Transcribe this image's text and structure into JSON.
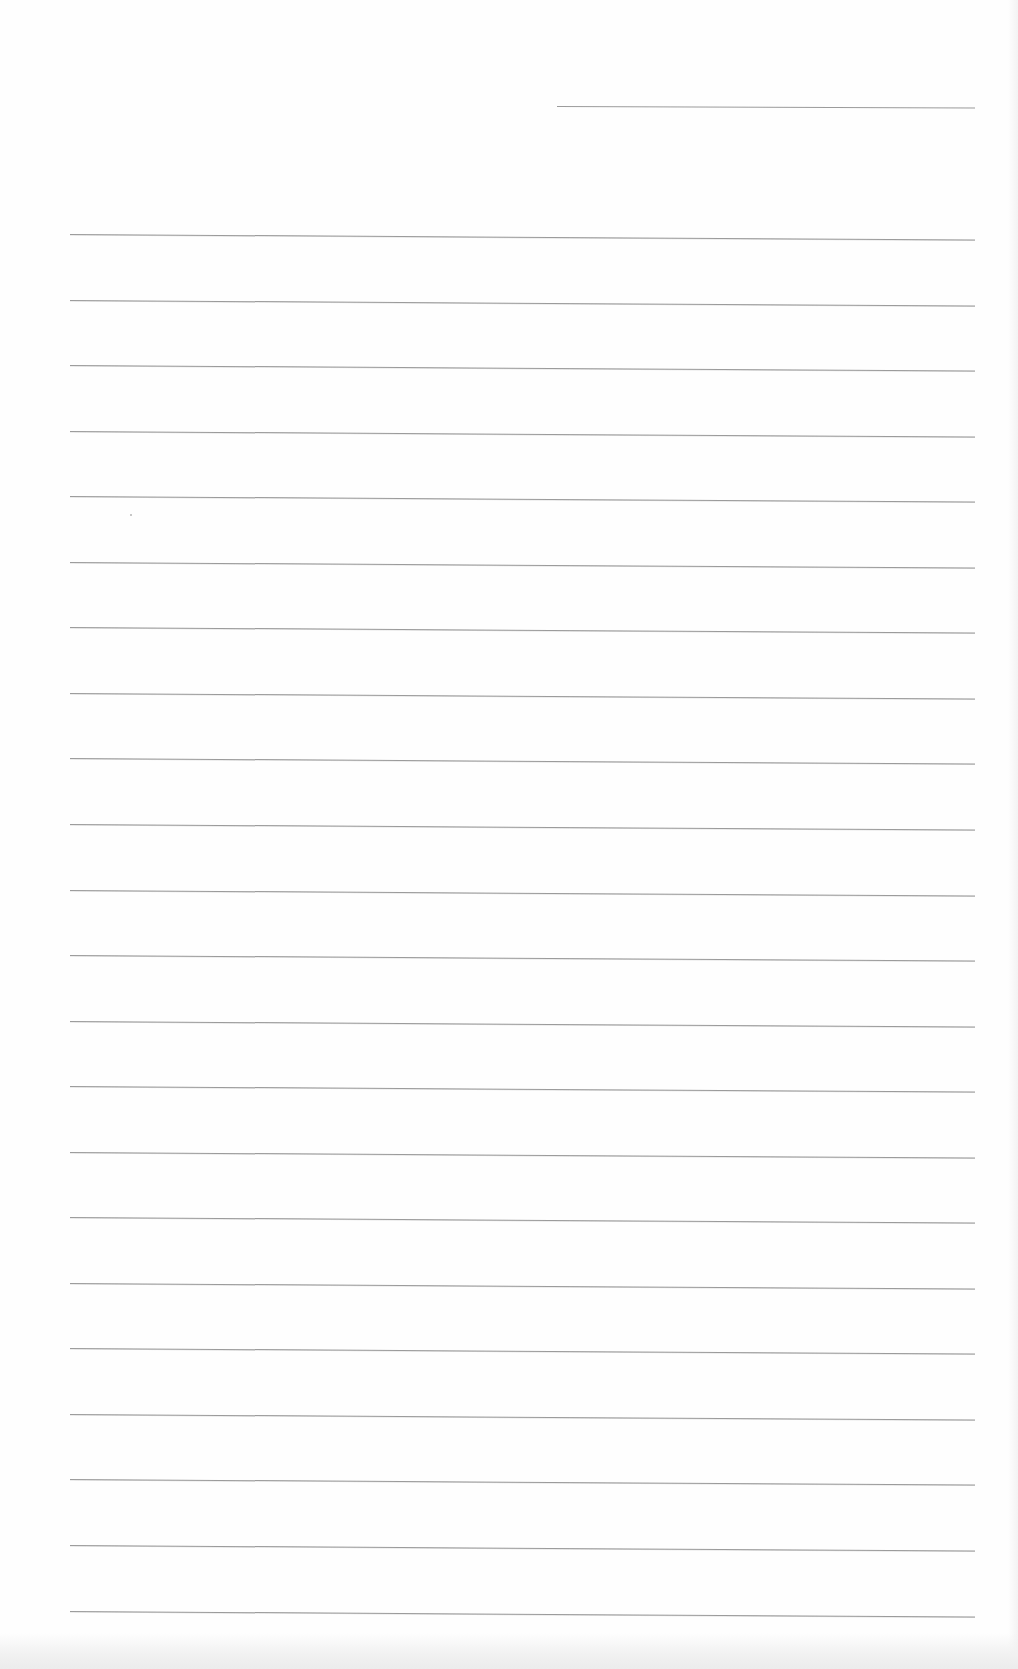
{
  "document": {
    "type": "lined-paper",
    "content_text": "",
    "colors": {
      "paper": "#fefefe",
      "rule_line": "#8a8a8a",
      "scan_band": "#ececec"
    },
    "header_line": {
      "x_start": 557,
      "x_end": 975,
      "y": 106
    },
    "ruled_lines": {
      "count": 22,
      "x_start": 70,
      "x_end": 975,
      "first_y": 234,
      "spacing": 65.55
    }
  }
}
